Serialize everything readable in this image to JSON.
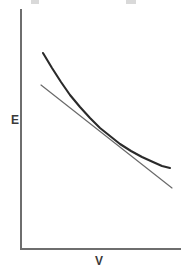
{
  "figure": {
    "width": 188,
    "height": 271,
    "background_color": "#ffffff"
  },
  "chart_data": {
    "type": "line",
    "title": "",
    "subtitle": "",
    "xlabel": "V",
    "ylabel": "E",
    "xlim": [
      0,
      1
    ],
    "ylim": [
      0,
      1
    ],
    "grid": false,
    "legend": null,
    "ticks": {
      "x": [],
      "y": []
    },
    "axis_style": {
      "spines": [
        "left",
        "bottom"
      ],
      "color": "#6e6e6e",
      "width_px": 2,
      "origin_px": [
        21,
        249
      ],
      "x_end_px": [
        180,
        249
      ],
      "y_end_px": [
        21,
        10
      ]
    },
    "series": [
      {
        "name": "energy-curve",
        "role": "curve",
        "style": "solid",
        "color": "#2a2a2a",
        "width_px": 2.1,
        "description": "convex decreasing energy versus volume curve",
        "points_px": [
          [
            43,
            53
          ],
          [
            52,
            68
          ],
          [
            61,
            82
          ],
          [
            70,
            95
          ],
          [
            80,
            107
          ],
          [
            90,
            118
          ],
          [
            100,
            128
          ],
          [
            110,
            136
          ],
          [
            120,
            144
          ],
          [
            131,
            151
          ],
          [
            142,
            157
          ],
          [
            153,
            162
          ],
          [
            162,
            166
          ],
          [
            170,
            168
          ]
        ]
      },
      {
        "name": "tangent-line",
        "role": "straight-line",
        "style": "solid",
        "color": "#6a6a6a",
        "width_px": 1.2,
        "description": "straight chord or tangent line touching the curve near its middle",
        "points_px": [
          [
            41,
            85
          ],
          [
            172,
            188
          ]
        ]
      }
    ],
    "annotations": [
      {
        "name": "tangency-region",
        "text": "",
        "x_px": 103,
        "y_px": 130
      }
    ]
  },
  "labels": {
    "y_axis": "E",
    "x_axis": "V"
  },
  "colors": {
    "axis": "#6e6e6e",
    "curve": "#2a2a2a",
    "line": "#6a6a6a",
    "label_text": "#3a3a3a",
    "background": "#ffffff"
  },
  "top_fragments": {
    "present": true,
    "note": ""
  }
}
